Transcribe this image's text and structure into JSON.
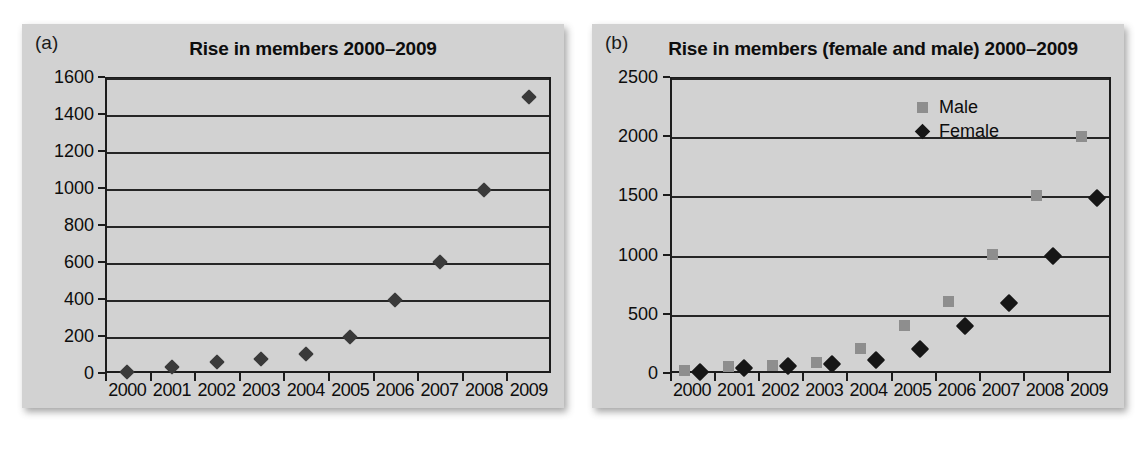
{
  "figure": {
    "background": "#ffffff",
    "panel_color": "#d2d2d2"
  },
  "panels": [
    {
      "label": "(a)",
      "title": "Rise in members 2000–2009"
    },
    {
      "label": "(b)",
      "title": "Rise in members (female and male) 2000–2009"
    }
  ],
  "legend": {
    "position": "top-right-inside",
    "entries": [
      {
        "label": "Male",
        "marker": "square-icon",
        "color": "#8e8e8e"
      },
      {
        "label": "Female",
        "marker": "diamond-icon",
        "color": "#161616"
      }
    ]
  },
  "chart_data": [
    {
      "type": "scatter",
      "panel": "(a)",
      "title": "Rise in members 2000–2009",
      "xlabel": "",
      "ylabel": "",
      "categories": [
        "2000",
        "2001",
        "2002",
        "2003",
        "2004",
        "2005",
        "2006",
        "2007",
        "2008",
        "2009"
      ],
      "ytick_labels": [
        "0",
        "200",
        "400",
        "600",
        "800",
        "1000",
        "1200",
        "1400",
        "1600"
      ],
      "yticks": [
        0,
        200,
        400,
        600,
        800,
        1000,
        1200,
        1400,
        1600
      ],
      "ylim": [
        0,
        1600
      ],
      "grid": true,
      "legend": false,
      "series": [
        {
          "name": "Members",
          "marker": "diamond-icon",
          "color": "#3a3a3a",
          "values": [
            5,
            35,
            60,
            75,
            105,
            195,
            395,
            600,
            990,
            1490
          ]
        }
      ]
    },
    {
      "type": "scatter",
      "panel": "(b)",
      "title": "Rise in members (female and male) 2000–2009",
      "xlabel": "",
      "ylabel": "",
      "categories": [
        "2000",
        "2001",
        "2002",
        "2003",
        "2004",
        "2005",
        "2006",
        "2007",
        "2008",
        "2009"
      ],
      "ytick_labels": [
        "0",
        "500",
        "1000",
        "1500",
        "2000",
        "2500"
      ],
      "yticks": [
        0,
        500,
        1000,
        1500,
        2000,
        2500
      ],
      "ylim": [
        0,
        2500
      ],
      "grid": true,
      "legend": true,
      "series": [
        {
          "name": "Male",
          "marker": "square-icon",
          "color": "#8e8e8e",
          "offset": -0.18,
          "values": [
            20,
            55,
            60,
            85,
            210,
            400,
            600,
            1000,
            1500,
            2000
          ]
        },
        {
          "name": "Female",
          "marker": "diamond-icon",
          "color": "#161616",
          "offset": 0.18,
          "values": [
            10,
            40,
            55,
            75,
            110,
            200,
            395,
            595,
            990,
            1480
          ]
        }
      ]
    }
  ]
}
